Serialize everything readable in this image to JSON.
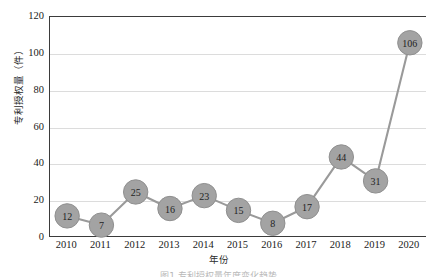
{
  "chart_data": {
    "type": "line",
    "title": "",
    "xlabel": "年份",
    "ylabel": "专利授权量（件）",
    "categories": [
      "2010",
      "2011",
      "2012",
      "2013",
      "2014",
      "2015",
      "2016",
      "2017",
      "2018",
      "2019",
      "2020"
    ],
    "values": [
      12,
      7,
      25,
      16,
      23,
      15,
      8,
      17,
      44,
      31,
      106
    ],
    "series": [
      {
        "name": "专利授权量",
        "values": [
          12,
          7,
          25,
          16,
          23,
          15,
          8,
          17,
          44,
          31,
          106
        ]
      }
    ],
    "ylim": [
      0,
      120
    ],
    "yticks": [
      0,
      20,
      40,
      60,
      80,
      100,
      120
    ],
    "ytick_labels": [
      "0",
      "20",
      "40",
      "60",
      "80",
      "100",
      "120"
    ],
    "grid": true,
    "grid_axis": "y",
    "legend": false,
    "legend_position": "none",
    "data_labels": true,
    "marker": "circle",
    "colors": {
      "line": "#9a9a9a",
      "marker_fill": "#a3a3a3",
      "marker_edge": "#8f8f8f",
      "marker_label": "#1f1f1f",
      "gridline": "#dcdcdc",
      "axis": "#3b3b3b",
      "background": "#ffffff",
      "tick_label": "#1a1a1a",
      "axis_title": "#2b2b2b"
    }
  },
  "caption": {
    "text": "图1 专利授权量年度变化趋势"
  }
}
